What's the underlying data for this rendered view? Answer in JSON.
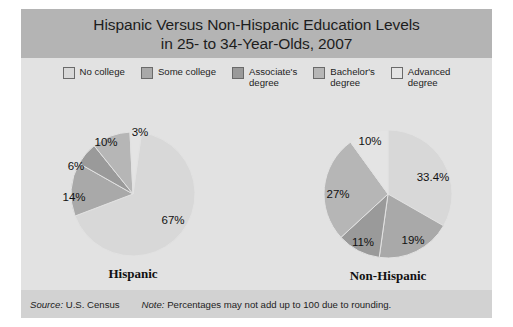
{
  "figure": {
    "title": "Hispanic Versus Non-Hispanic Education Levels\nin 25- to 34-Year-Olds, 2007",
    "source_label": "Source:",
    "source_text": "U.S. Census",
    "note_label": "Note:",
    "note_text": "Percentages may not add up to 100 due to rounding."
  },
  "legend": {
    "items": [
      {
        "label": "No college",
        "color": "#d8d8d8"
      },
      {
        "label": "Some college",
        "color": "#a9a9a9"
      },
      {
        "label": "Associate's\ndegree",
        "color": "#9a9a9a"
      },
      {
        "label": "Bachelor's\ndegree",
        "color": "#b6b6b6"
      },
      {
        "label": "Advanced\ndegree",
        "color": "#e4e4e4"
      }
    ]
  },
  "chart_data": {
    "type": "pie",
    "title": "Hispanic Versus Non-Hispanic Education Levels in 25- to 34-Year-Olds, 2007",
    "categories": [
      "No college",
      "Some college",
      "Associate's degree",
      "Bachelor's degree",
      "Advanced degree"
    ],
    "colors": [
      "#d8d8d8",
      "#a9a9a9",
      "#9a9a9a",
      "#b6b6b6",
      "#e4e4e4"
    ],
    "legend_position": "top",
    "series": [
      {
        "name": "Hispanic",
        "values": [
          67,
          14,
          6,
          10,
          3
        ],
        "labels": [
          "67%",
          "14%",
          "6%",
          "10%",
          "3%"
        ]
      },
      {
        "name": "Non-Hispanic",
        "values": [
          33.4,
          19,
          11,
          27,
          10
        ],
        "labels": [
          "33.4%",
          "19%",
          "11%",
          "27%",
          "10%"
        ]
      }
    ],
    "note": "Percentages may not add up to 100 due to rounding.",
    "source": "U.S. Census"
  },
  "pies": [
    {
      "caption": "Hispanic",
      "cx": 112,
      "cy": 100,
      "r": 62,
      "start_angle": 8,
      "labels": [
        {
          "text": "67%",
          "x": 152,
          "y": 126
        },
        {
          "text": "14%",
          "x": 53,
          "y": 103
        },
        {
          "text": "6%",
          "x": 55,
          "y": 72
        },
        {
          "text": "10%",
          "x": 85,
          "y": 48
        },
        {
          "text": "3%",
          "x": 119,
          "y": 38
        }
      ]
    },
    {
      "caption": "Non-Hispanic",
      "cx": 367,
      "cy": 100,
      "r": 64,
      "start_angle": 0,
      "labels": [
        {
          "text": "33.4%",
          "x": 412,
          "y": 83
        },
        {
          "text": "19%",
          "x": 392,
          "y": 146
        },
        {
          "text": "11%",
          "x": 342,
          "y": 148
        },
        {
          "text": "27%",
          "x": 317,
          "y": 100
        },
        {
          "text": "10%",
          "x": 349,
          "y": 47
        }
      ]
    }
  ]
}
